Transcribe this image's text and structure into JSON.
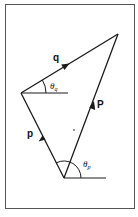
{
  "figure": {
    "type": "vector-triangle-diagram",
    "vectors": [
      {
        "name": "p",
        "label": "p",
        "from": [
          64,
          178
        ],
        "to": [
          21,
          93
        ]
      },
      {
        "name": "q",
        "label": "q",
        "from": [
          21,
          93
        ],
        "to": [
          118,
          34
        ]
      },
      {
        "name": "P",
        "label": "P",
        "from": [
          64,
          178
        ],
        "to": [
          118,
          34
        ]
      }
    ],
    "angles": [
      {
        "name": "theta_q",
        "label": "θq",
        "symbol": "θ",
        "subscript": "q"
      },
      {
        "name": "theta_p",
        "label": "θp",
        "symbol": "θ",
        "subscript": "p"
      }
    ],
    "colors": {
      "line": "#1a1a1a",
      "frame": "#555555",
      "background": "#ffffff"
    }
  }
}
